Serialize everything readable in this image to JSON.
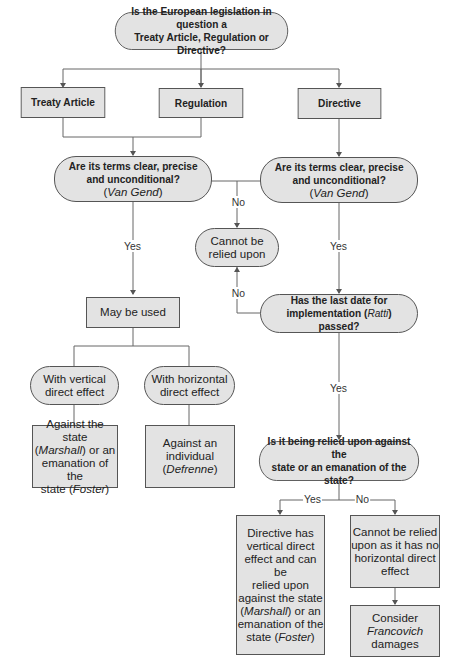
{
  "nodes": {
    "q_type": {
      "l1": "Is the European legislation in question a",
      "l2": "Treaty Article, Regulation or Directive?"
    },
    "treaty": "Treaty Article",
    "regulation": "Regulation",
    "directive": "Directive",
    "q_terms_left": {
      "l1": "Are its terms clear, precise",
      "l2": "and unconditional?",
      "case_open": "(",
      "case": "Van Gend",
      "case_close": ")"
    },
    "q_terms_right": {
      "l1": "Are its terms clear, precise",
      "l2": "and unconditional?",
      "case_open": "(",
      "case": "Van Gend",
      "case_close": ")"
    },
    "cannot_relied": {
      "l1": "Cannot be",
      "l2": "relied upon"
    },
    "may_be_used": "May be used",
    "q_date": {
      "l1": "Has the last date for",
      "l2a": "implementation (",
      "case": "Ratti",
      "l2b": ") passed?"
    },
    "vertical": {
      "l1": "With vertical",
      "l2": "direct effect"
    },
    "horizontal": {
      "l1": "With horizontal",
      "l2": "direct effect"
    },
    "against_state": {
      "l1": "Against the state",
      "l2a": "(",
      "case1": "Marshall",
      "l2b": ") or an",
      "l3": "emanation of the",
      "l4a": "state (",
      "case2": "Foster",
      "l4b": ")"
    },
    "against_individual": {
      "l1": "Against an",
      "l2": "individual",
      "l3a": "(",
      "case": "Defrenne",
      "l3b": ")"
    },
    "q_state": {
      "l1": "Is it being relied upon against the",
      "l2": "state or an emanation of the state?"
    },
    "directive_vertical": {
      "l1": "Directive has",
      "l2": "vertical direct",
      "l3": "effect and can be",
      "l4": "relied upon",
      "l5": "against the state",
      "l6a": "(",
      "case1": "Marshall",
      "l6b": ") or an",
      "l7": "emanation of the",
      "l8a": "state (",
      "case2": "Foster",
      "l8b": ")"
    },
    "no_horizontal": {
      "l1": "Cannot be relied",
      "l2": "upon as it has no",
      "l3": "horizontal direct",
      "l4": "effect"
    },
    "francovich": {
      "l1": "Consider",
      "case": "Francovich",
      "l3": "damages"
    }
  },
  "edge_labels": {
    "no_terms": "No",
    "yes_left": "Yes",
    "yes_right": "Yes",
    "no_date": "No",
    "yes_date": "Yes",
    "yes_state": "Yes",
    "no_state": "No"
  },
  "colors": {
    "box_fill": "#e3e3e3",
    "line": "#555555"
  }
}
